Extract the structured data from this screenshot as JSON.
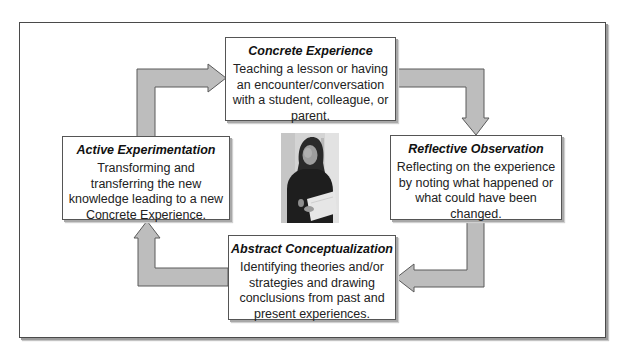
{
  "diagram": {
    "type": "cycle",
    "colors": {
      "arrow_fill": "#bdbdbd",
      "arrow_stroke": "#5a5a5a",
      "box_border": "#555555",
      "frame_border": "#4a4a4a"
    },
    "stages": [
      {
        "id": "concrete",
        "title": "Concrete Experience",
        "description": "Teaching a lesson or having an encounter/conversation with a student, colleague, or parent."
      },
      {
        "id": "reflective",
        "title": "Reflective Observation",
        "description": "Reflecting on the experience by noting what happened or what could have been changed."
      },
      {
        "id": "abstract",
        "title": "Abstract Conceptualization",
        "description": "Identifying theories and/or strategies and drawing conclusions from past and present experiences."
      },
      {
        "id": "active",
        "title": "Active Experimentation",
        "description": "Transforming and transferring the new knowledge leading to a new Concrete Experience."
      }
    ],
    "flow": [
      {
        "from": "concrete",
        "to": "reflective"
      },
      {
        "from": "reflective",
        "to": "abstract"
      },
      {
        "from": "abstract",
        "to": "active"
      },
      {
        "from": "active",
        "to": "concrete"
      }
    ],
    "center_image": {
      "description": "grayscale photo of a woman holding papers"
    }
  }
}
